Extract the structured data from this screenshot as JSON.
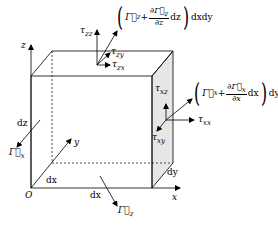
{
  "diagram": {
    "axes": {
      "x": "x",
      "y": "y",
      "z": "z",
      "origin": "O"
    },
    "dimensions": {
      "dx_bottom": "dx",
      "dx_depth": "dx",
      "dy": "dy",
      "dz": "dz"
    },
    "top_face": {
      "flux_expr": {
        "open": "(",
        "base": "Γ⃗",
        "base_sub": "z",
        "plus": "+",
        "num": "∂Γ⃗",
        "num_sub": "z",
        "den": "∂z",
        "d": "dz",
        "close": ")",
        "tail": "dxdy"
      },
      "stresses": [
        {
          "label": "τ",
          "sub": "zz"
        },
        {
          "label": "τ",
          "sub": "zy"
        },
        {
          "label": "τ",
          "sub": "zx"
        }
      ]
    },
    "right_face": {
      "flux_expr": {
        "open": "(",
        "base": "Γ⃗",
        "base_sub": "x",
        "plus": "+",
        "num": "∂Γ⃗",
        "num_sub": "x",
        "den": "∂x",
        "d": "dx",
        "close": ")",
        "tail": "dydz"
      },
      "stresses": [
        {
          "label": "τ",
          "sub": "xz"
        },
        {
          "label": "τ",
          "sub": "xx"
        },
        {
          "label": "τ",
          "sub": "xy"
        }
      ]
    },
    "inflow_labels": [
      {
        "label": "Γ⃗",
        "sub": "x"
      },
      {
        "label": "Γ⃗",
        "sub": "z"
      }
    ],
    "colors": {
      "line": "#000000",
      "shade": "#e6e6e6",
      "background": "#ffffff"
    }
  }
}
